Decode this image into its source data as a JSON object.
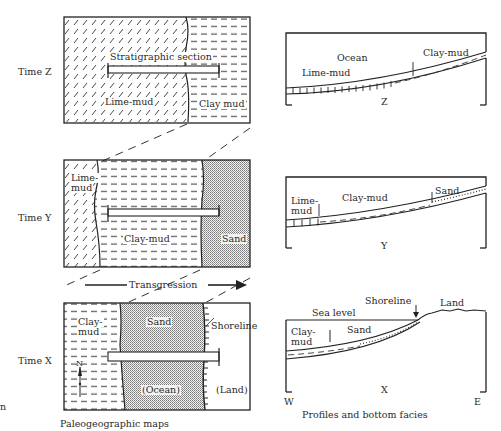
{
  "figure": {
    "stray_edge_char": "n",
    "captions": {
      "left": "Paleogeographic maps",
      "right": "Profiles and bottom facies"
    },
    "transgression_label": "Transgression",
    "time_labels": [
      "Time Z",
      "Time Y",
      "Time X"
    ],
    "maps": {
      "z": {
        "section_label": "Stratigraphic section",
        "lime": "Lime-mud",
        "clay": "Clay mud"
      },
      "y": {
        "lime_line1": "Lime-",
        "lime_line2": "mud",
        "clay": "Clay-mud",
        "sand": "Sand"
      },
      "x": {
        "clay_line1": "Clay-",
        "clay_line2": "mud",
        "sand": "Sand",
        "ocean": "(Ocean)",
        "land": "(Land)",
        "shoreline": "Shoreline",
        "north": "N"
      }
    },
    "profiles": {
      "z": {
        "ocean": "Ocean",
        "lime": "Lime-mud",
        "clay": "Clay-mud",
        "letter": "Z"
      },
      "y": {
        "lime_line1": "Lime-",
        "lime_line2": "mud",
        "clay": "Clay-mud",
        "sand": "Sand",
        "letter": "Y"
      },
      "x": {
        "sea_level": "Sea level",
        "shoreline": "Shoreline",
        "land": "Land",
        "clay_line1": "Clay-",
        "clay_line2": "mud",
        "sand": "Sand",
        "letter": "X",
        "west": "W",
        "east": "E"
      }
    }
  }
}
